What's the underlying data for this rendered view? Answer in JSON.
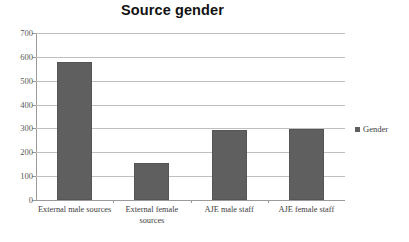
{
  "chart_data": {
    "type": "bar",
    "title": "Source gender",
    "xlabel": "",
    "ylabel": "",
    "categories": [
      "External male sources",
      "External female sources",
      "AJE male staff",
      "AJE female staff"
    ],
    "values": [
      578,
      155,
      292,
      298
    ],
    "series": [
      {
        "name": "Gender",
        "values": [
          578,
          155,
          292,
          298
        ]
      }
    ],
    "ylim": [
      0,
      700
    ],
    "yticks": [
      0,
      100,
      200,
      300,
      400,
      500,
      600,
      700
    ],
    "ytick_labels": [
      "0",
      "100",
      "200",
      "300",
      "400",
      "500",
      "600",
      "700"
    ],
    "grid": true,
    "legend": {
      "position": "right",
      "entries": [
        "Gender"
      ]
    },
    "colors": {
      "bar": "#5f5f5f",
      "grid": "#bfbfbf",
      "axis": "#9a9a9a",
      "title": "#121212",
      "label": "#3d3d3d"
    }
  },
  "legend": {
    "swatch_name": "legend-color-swatch",
    "label": "Gender"
  }
}
